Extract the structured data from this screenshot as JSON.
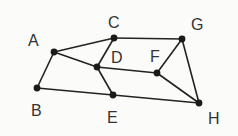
{
  "diagram": {
    "type": "undirected-graph",
    "nodes": [
      {
        "id": "A",
        "label": "A",
        "x": 54,
        "y": 52,
        "lx": 28,
        "ly": 46
      },
      {
        "id": "B",
        "label": "B",
        "x": 37,
        "y": 88,
        "lx": 31,
        "ly": 116
      },
      {
        "id": "C",
        "label": "C",
        "x": 114,
        "y": 38,
        "lx": 108,
        "ly": 28
      },
      {
        "id": "D",
        "label": "D",
        "x": 97,
        "y": 67,
        "lx": 111,
        "ly": 63
      },
      {
        "id": "E",
        "label": "E",
        "x": 113,
        "y": 95,
        "lx": 107,
        "ly": 123
      },
      {
        "id": "F",
        "label": "F",
        "x": 157,
        "y": 73,
        "lx": 150,
        "ly": 62
      },
      {
        "id": "G",
        "label": "G",
        "x": 182,
        "y": 39,
        "lx": 191,
        "ly": 30
      },
      {
        "id": "H",
        "label": "H",
        "x": 199,
        "y": 103,
        "lx": 208,
        "ly": 124
      }
    ],
    "edges": [
      [
        "A",
        "C"
      ],
      [
        "A",
        "D"
      ],
      [
        "A",
        "B"
      ],
      [
        "C",
        "D"
      ],
      [
        "C",
        "G"
      ],
      [
        "D",
        "F"
      ],
      [
        "D",
        "E"
      ],
      [
        "B",
        "E"
      ],
      [
        "E",
        "H"
      ],
      [
        "F",
        "G"
      ],
      [
        "F",
        "H"
      ],
      [
        "G",
        "H"
      ]
    ]
  }
}
